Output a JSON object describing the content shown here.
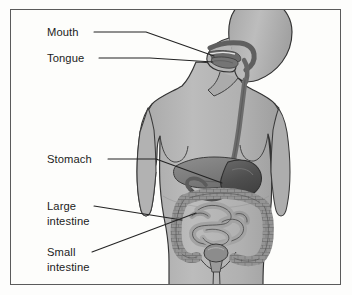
{
  "figure": {
    "style": "grayscale anatomical illustration",
    "border_color": "#5b5b5b",
    "background_color": "#fdfdfb"
  },
  "labels": [
    {
      "id": "mouth",
      "name": "Mouth",
      "lines": [
        "Mouth"
      ],
      "text_x": 47,
      "text_y": 36,
      "leader": "M 94,32 L 146,32 L 214,56",
      "target": "oral cavity"
    },
    {
      "id": "tongue",
      "name": "Tongue",
      "lines": [
        "Tongue"
      ],
      "text_x": 47,
      "text_y": 62,
      "leader": "M 99,58 L 150,58 L 213,62",
      "target": "tongue"
    },
    {
      "id": "stomach",
      "name": "Stomach",
      "lines": [
        "Stomach"
      ],
      "text_x": 47,
      "text_y": 163,
      "leader": "M 108,159 L 156,159 L 222,183",
      "target": "stomach"
    },
    {
      "id": "large-intestine",
      "name": "Large intestine",
      "lines": [
        "Large",
        "intestine"
      ],
      "text_x": 47,
      "text_y": 210,
      "leader": "M 94,206 L 182,220",
      "target": "large intestine"
    },
    {
      "id": "small-intestine",
      "name": "Small intestine",
      "lines": [
        "Small",
        "intestine"
      ],
      "text_x": 47,
      "text_y": 256,
      "leader": "M 92,252 L 196,213",
      "target": "small intestine"
    }
  ],
  "organs": {
    "body_fill": "#b4b4b4",
    "body_outline": "#3a3a3a",
    "esophagus_fill": "#6e6e6e",
    "stomach_fill": "#585858",
    "liver_fill": "#8a8a8a",
    "large_intestine_fill": "#8f8f8f",
    "small_intestine_fill": "#a0a0a0",
    "oral_cavity_fill": "#707070"
  },
  "colors": {
    "text": "#1c1c1c",
    "leader_line": "#232323"
  }
}
